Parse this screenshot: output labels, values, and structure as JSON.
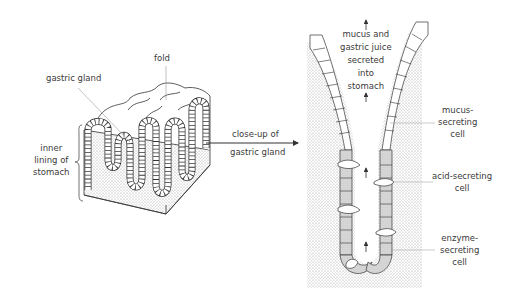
{
  "left_panel": {
    "labels": {
      "fold": "fold",
      "gastric_gland": "gastric gland",
      "inner_lining": [
        "inner",
        "lining of",
        "stomach"
      ]
    }
  },
  "connector": {
    "label": [
      "close-up of",
      "gastric gland"
    ]
  },
  "right_panel": {
    "secretion_label": [
      "mucus and",
      "gastric juice",
      "secreted",
      "into",
      "stomach"
    ],
    "cell_labels": {
      "mucus": [
        "mucus-",
        "secreting",
        "cell"
      ],
      "acid": [
        "acid-secreting",
        "cell"
      ],
      "enzyme": [
        "enzyme-",
        "secreting",
        "cell"
      ]
    }
  },
  "colors": {
    "line": "#333333",
    "stipple": "#bdbdbd",
    "cell_shaded": "#d6d6d6",
    "leader": "#aaaaaa"
  }
}
